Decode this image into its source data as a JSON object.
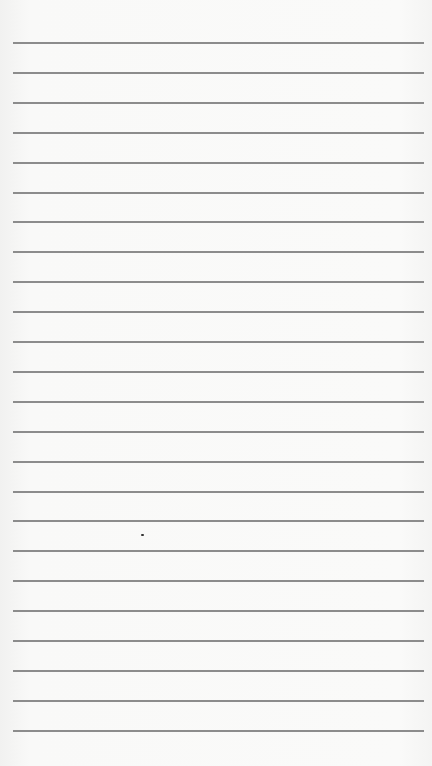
{
  "page": {
    "type": "lined-paper",
    "background_color": "#f8f8f7",
    "line_color": "#8c8c8c",
    "line_count": 24,
    "first_line_y": 42,
    "line_spacing": 29.9
  }
}
